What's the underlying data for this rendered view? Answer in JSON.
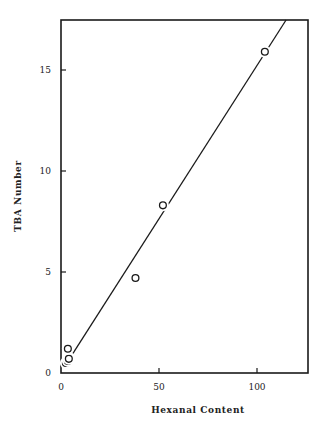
{
  "chart_data": {
    "type": "scatter",
    "title": "",
    "xlabel": "Hexanal Content",
    "ylabel": "TBA Number",
    "xlim": [
      0,
      125
    ],
    "ylim": [
      0,
      17.5
    ],
    "xticks": [
      0,
      50,
      100
    ],
    "yticks": [
      0,
      5,
      10,
      15
    ],
    "grid": false,
    "legend": null,
    "series": [
      {
        "name": "observations",
        "marker": "open-circle",
        "x": [
          2.5,
          3.5,
          4,
          4,
          3.5,
          38,
          52,
          104
        ],
        "y": [
          0.5,
          0.6,
          0.75,
          0.7,
          1.2,
          4.7,
          8.3,
          15.9
        ]
      }
    ],
    "fit_line": {
      "type": "linear",
      "x": [
        3,
        115
      ],
      "y": [
        0.5,
        17.5
      ]
    }
  }
}
